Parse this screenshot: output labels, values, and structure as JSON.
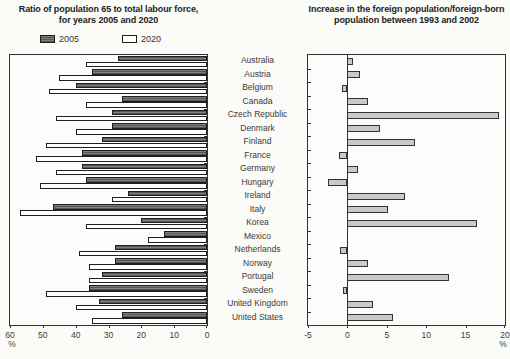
{
  "countries": [
    "Australia",
    "Austria",
    "Belgium",
    "Canada",
    "Czech Republic",
    "Denmark",
    "Finland",
    "France",
    "Germany",
    "Hungary",
    "Ireland",
    "Italy",
    "Korea",
    "Mexico",
    "Netherlands",
    "Norway",
    "Portugal",
    "Sweden",
    "United Kingdom",
    "United States"
  ],
  "colors": {
    "bar_2005": "#6a6a6a",
    "bar_2020": "#ffffff",
    "bar_right": "#c9c9c9",
    "frame": "#333333",
    "background": "#fbfbf8"
  },
  "chart_data": [
    {
      "type": "bar",
      "orientation": "horizontal",
      "title": "Ratio of population 65 to total labour force, for years 2005 and 2020",
      "title_line1": "Ratio of population 65 to total labour force,",
      "title_line2": "for years 2005 and 2020",
      "categories": [
        "Australia",
        "Austria",
        "Belgium",
        "Canada",
        "Czech Republic",
        "Denmark",
        "Finland",
        "France",
        "Germany",
        "Hungary",
        "Ireland",
        "Italy",
        "Korea",
        "Mexico",
        "Netherlands",
        "Norway",
        "Portugal",
        "Sweden",
        "United Kingdom",
        "United States"
      ],
      "series": [
        {
          "name": "2005",
          "values": [
            27,
            35,
            40,
            26,
            29,
            29,
            32,
            38,
            38,
            37,
            24,
            47,
            20,
            13,
            28,
            28,
            32,
            36,
            33,
            26
          ]
        },
        {
          "name": "2020",
          "values": [
            37,
            45,
            48,
            37,
            46,
            40,
            49,
            52,
            46,
            51,
            29,
            57,
            37,
            18,
            39,
            36,
            36,
            49,
            40,
            35
          ]
        }
      ],
      "xlabel": "",
      "ylabel": "",
      "axis_reversed": true,
      "xlim": [
        60,
        0
      ],
      "ticks": [
        60,
        50,
        40,
        30,
        20,
        10,
        0
      ],
      "unit": "%",
      "legend_position": "top",
      "grid": false
    },
    {
      "type": "bar",
      "orientation": "horizontal",
      "title": "Increase in the foreign population/foreign-born population between 1993 and 2002",
      "title_line1": "Increase in the foreign population/foreign-born",
      "title_line2": "population between 1993 and 2002",
      "categories": [
        "Australia",
        "Austria",
        "Belgium",
        "Canada",
        "Czech Republic",
        "Denmark",
        "Finland",
        "France",
        "Germany",
        "Hungary",
        "Ireland",
        "Italy",
        "Korea",
        "Mexico",
        "Netherlands",
        "Norway",
        "Portugal",
        "Sweden",
        "United Kingdom",
        "United States"
      ],
      "values": [
        0.7,
        1.6,
        -0.7,
        2.6,
        19.2,
        4.1,
        8.6,
        -1.1,
        1.3,
        -2.4,
        7.3,
        5.2,
        16.5,
        0,
        -0.9,
        2.6,
        12.9,
        -0.5,
        3.2,
        5.8
      ],
      "xlabel": "",
      "ylabel": "",
      "xlim": [
        -5,
        20
      ],
      "ticks": [
        -5,
        0,
        5,
        10,
        15,
        20
      ],
      "unit": "%",
      "zero_line": true,
      "grid": false
    }
  ]
}
